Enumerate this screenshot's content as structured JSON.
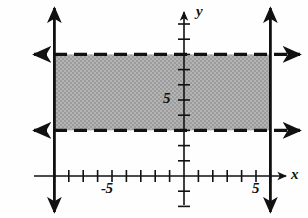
{
  "figure": {
    "kind": "cartesian-graph"
  },
  "axes": {
    "x_axis_label": "x",
    "y_axis_label": "y",
    "x_tick_labels": [
      "-5",
      "5"
    ],
    "y_tick_labels": [
      "5"
    ],
    "origin_px": {
      "x": 184,
      "y": 176
    },
    "unit_px": {
      "x": 14.4,
      "y": 15.2
    },
    "x_range": [
      -10.2,
      8.5
    ],
    "y_range": [
      -2.7,
      11.5
    ],
    "x_ticks": [
      -9,
      -8,
      -7,
      -6,
      -5,
      -4,
      -3,
      -2,
      -1,
      1,
      2,
      3,
      4,
      5,
      6
    ],
    "y_ticks": [
      -2,
      -1,
      1,
      2,
      3,
      4,
      5,
      6,
      7,
      8
    ],
    "labeled_x_ticks": [
      -5,
      5
    ],
    "labeled_y_ticks": [
      5
    ]
  },
  "chart_data": {
    "type": "line",
    "title": "",
    "xlabel": "x",
    "ylabel": "y",
    "grid": false,
    "legend": "none",
    "xlim": [
      -10.2,
      8.5
    ],
    "ylim": [
      -2.7,
      11.5
    ],
    "boundary_lines": [
      {
        "name": "upper-horizontal",
        "orientation": "horizontal",
        "value": 8,
        "style": "dashed",
        "arrows": "both"
      },
      {
        "name": "lower-horizontal",
        "orientation": "horizontal",
        "value": 3,
        "style": "dashed",
        "arrows": "both"
      },
      {
        "name": "left-vertical",
        "orientation": "vertical",
        "value": -9,
        "style": "solid",
        "arrows": "both"
      },
      {
        "name": "right-vertical",
        "orientation": "vertical",
        "value": 6,
        "style": "solid",
        "arrows": "both"
      }
    ],
    "shaded_region": {
      "x_min": -9,
      "x_max": 6,
      "y_min": 3,
      "y_max": 8,
      "fill": "#a9a9a9",
      "pattern": "stipple"
    }
  },
  "colors": {
    "ink": "#111111",
    "shade": "#a9a9a9",
    "background": "#fefefe"
  }
}
